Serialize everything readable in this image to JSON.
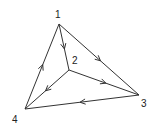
{
  "graph": {
    "directed": true,
    "nodes": [
      {
        "id": "1",
        "label": "1",
        "x": 59,
        "y": 24,
        "lx": 55,
        "ly": 18
      },
      {
        "id": "2",
        "label": "2",
        "x": 69,
        "y": 70,
        "lx": 72,
        "ly": 64
      },
      {
        "id": "3",
        "label": "3",
        "x": 139,
        "y": 95,
        "lx": 141,
        "ly": 107
      },
      {
        "id": "4",
        "label": "4",
        "x": 25,
        "y": 109,
        "lx": 12,
        "ly": 123
      }
    ],
    "edges": [
      {
        "from": "1",
        "to": "2"
      },
      {
        "from": "1",
        "to": "3"
      },
      {
        "from": "2",
        "to": "3"
      },
      {
        "from": "2",
        "to": "4"
      },
      {
        "from": "3",
        "to": "4"
      },
      {
        "from": "4",
        "to": "1"
      }
    ]
  },
  "colors": {
    "line": "#333333",
    "label": "#222222",
    "background": "#ffffff"
  }
}
